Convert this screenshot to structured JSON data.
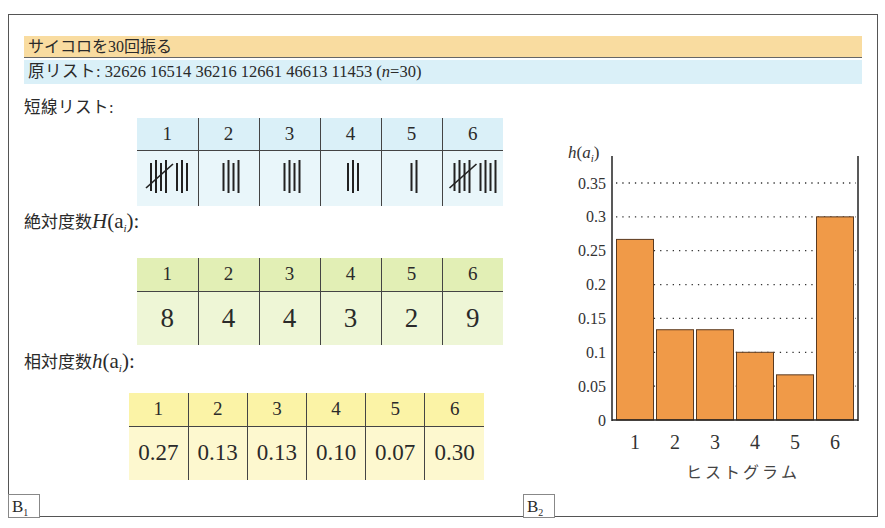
{
  "title": "サイコロを30回振る",
  "original_list": {
    "label": "原リスト:",
    "values": "32626 16514 36216 12661 46613 11453",
    "n_text_open": "(",
    "n_var": "n",
    "n_text_rest": "=30)"
  },
  "tally_section": {
    "label": "短線リスト:",
    "header": [
      "1",
      "2",
      "3",
      "4",
      "5",
      "6"
    ],
    "counts": [
      8,
      4,
      4,
      3,
      2,
      9
    ],
    "header_color": "#daf0f8",
    "body_color": "#e9f6fa"
  },
  "absolute_section": {
    "label_prefix": "絶対度数",
    "label_func": "H",
    "label_arg": "(a",
    "label_sub": "i",
    "label_suffix": "):",
    "header": [
      "1",
      "2",
      "3",
      "4",
      "5",
      "6"
    ],
    "values": [
      "8",
      "4",
      "4",
      "3",
      "2",
      "9"
    ],
    "header_color": "#e2efb5",
    "body_color": "#eef6d6"
  },
  "relative_section": {
    "label_prefix": "相対度数",
    "label_func": "h",
    "label_arg": "(a",
    "label_sub": "i",
    "label_suffix": "):",
    "header": [
      "1",
      "2",
      "3",
      "4",
      "5",
      "6"
    ],
    "values": [
      "0.27",
      "0.13",
      "0.13",
      "0.10",
      "0.07",
      "0.30"
    ],
    "header_color": "#fbf3a6",
    "body_color": "#fdf8cf"
  },
  "panel_labels": {
    "b1_main": "B",
    "b1_sub": "1",
    "b2_main": "B",
    "b2_sub": "2"
  },
  "chart_data": {
    "type": "bar",
    "title": "",
    "xlabel": "ヒストグラム",
    "ylabel": "h(a_i)",
    "categories": [
      "1",
      "2",
      "3",
      "4",
      "5",
      "6"
    ],
    "values": [
      0.2667,
      0.1333,
      0.1333,
      0.1,
      0.0667,
      0.3
    ],
    "ylim": [
      0,
      0.37
    ],
    "yticks": [
      "0",
      "0.05",
      "0.1",
      "0.15",
      "0.2",
      "0.25",
      "0.3",
      "0.35"
    ],
    "grid": "dotted horizontal",
    "legend": null,
    "bar_color": "#f09a48",
    "bar_edge_color": "#5a3a20"
  }
}
